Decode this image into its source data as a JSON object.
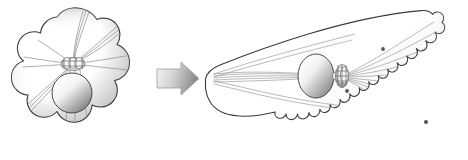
{
  "figure": {
    "domain": "Diagram",
    "title": "",
    "caption": "",
    "width": 468,
    "height": 160,
    "background_color": "#ffffff",
    "panels": [
      {
        "id": "left-panel",
        "name": "unpolarized-cell",
        "label": "",
        "bounds": {
          "x": 8,
          "y": 6,
          "width": 132,
          "height": 148
        },
        "shape": "scalloped-round-cell",
        "cell_membrane": {
          "name": "cell-membrane",
          "stroke_color": "#3a3a3a",
          "stroke_width": 1.1,
          "fill": "radial-gradient-white-to-grey",
          "fill_light": "#ffffff",
          "fill_shadow": "#9a9a9a",
          "lobes": 9
        },
        "nucleus": {
          "name": "nucleus",
          "center_x": 72,
          "center_y": 93,
          "radius_x": 20,
          "radius_y": 20,
          "stroke_color": "#4a4a4a",
          "fill_light": "#fdfdfd",
          "fill_shadow": "#8d8d8d"
        },
        "centrosome": {
          "name": "centrosome",
          "center_x": 73,
          "center_y": 64,
          "width": 22,
          "height": 13,
          "stroke_color": "#6e6e6e",
          "barrel_count": 5
        },
        "microtubules": {
          "name": "microtubule-array",
          "arrangement": "radial",
          "count": 16,
          "stroke_color": "#8c8c8c",
          "stroke_width": 0.7
        }
      },
      {
        "id": "arrow-panel",
        "name": "transition-arrow",
        "label": "",
        "bounds": {
          "x": 157,
          "y": 62,
          "width": 42,
          "height": 32
        },
        "direction": "right",
        "fill_start": "#f3f3f3",
        "fill_end": "#8e8e8e",
        "stroke_color": "#9d9d9d"
      },
      {
        "id": "right-panel",
        "name": "polarized-cell",
        "label": "",
        "bounds": {
          "x": 200,
          "y": 8,
          "width": 258,
          "height": 144
        },
        "shape": "wedge-cone-cell",
        "cell_membrane": {
          "name": "cell-membrane",
          "stroke_color": "#3a3a3a",
          "stroke_width": 1.1,
          "fill": "linear-gradient-white-to-grey",
          "fill_light": "#ffffff",
          "fill_shadow": "#b4b4b4",
          "trailing_edge": "rounded-tip-left",
          "leading_edge": "scalloped-right",
          "scallop_count": 9
        },
        "nucleus": {
          "name": "nucleus",
          "center_x": 316,
          "center_y": 76,
          "radius_x": 18,
          "radius_y": 22,
          "stroke_color": "#4a4a4a",
          "fill_light": "#fdfdfd",
          "fill_shadow": "#8d8d8d"
        },
        "centrosome": {
          "name": "centrosome",
          "center_x": 342,
          "center_y": 76,
          "width": 14,
          "height": 22,
          "stroke_color": "#6e6e6e",
          "barrel_count": 5
        },
        "microtubules": {
          "name": "microtubule-array",
          "arrangement": "polarized-fan",
          "count_forward": 9,
          "count_rearward": 6,
          "stroke_color": "#8c8c8c",
          "stroke_width": 0.6
        },
        "vesicles": {
          "name": "vesicle-particles",
          "count": 3,
          "color": "#555555",
          "positions": [
            {
              "x": 383,
              "y": 49
            },
            {
              "x": 347,
              "y": 91
            },
            {
              "x": 426,
              "y": 122
            }
          ]
        }
      }
    ],
    "colors": {
      "outline": "#3a3a3a",
      "microtubule": "#8c8c8c",
      "shadow": "#9a9a9a",
      "arrow_dark": "#8e8e8e",
      "arrow_light": "#f3f3f3",
      "vesicle": "#555555",
      "background": "#ffffff"
    }
  }
}
